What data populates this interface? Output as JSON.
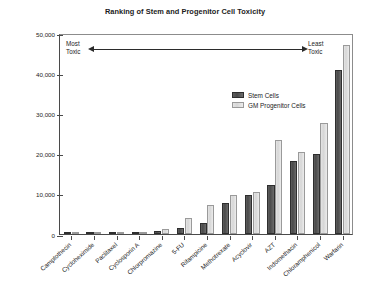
{
  "chart_data": {
    "type": "bar",
    "title": "Ranking of Stem and Progenitor Cell Toxicity",
    "xlabel": "",
    "ylabel": "Area Under the Dose Response Curve",
    "ylim": [
      0,
      50000
    ],
    "yticks": [
      0,
      10000,
      20000,
      30000,
      40000,
      50000
    ],
    "ytick_labels": [
      "0",
      "10,000",
      "20,000",
      "30,000",
      "40,000",
      "50,000"
    ],
    "grid": false,
    "legend_position": "upper center",
    "categories": [
      "Camptothecin",
      "Cycloheximide",
      "Paclitaxel",
      "Cyclosporin A",
      "Chlorpromazine",
      "5-FU",
      "Rifampicine",
      "Methotrexate",
      "Acyclovir",
      "AZT",
      "Indomethacin",
      "Chloramphenicol",
      "Warfarin"
    ],
    "series": [
      {
        "name": "Stem Cells",
        "color": "#4a4a4a",
        "values": [
          60,
          70,
          180,
          500,
          750,
          1600,
          2800,
          7600,
          9800,
          12200,
          18200,
          19800,
          40800
        ]
      },
      {
        "name": "GM Progenitor Cells",
        "color": "#d6d6d6",
        "values": [
          70,
          90,
          200,
          380,
          1150,
          3900,
          7100,
          9750,
          10400,
          23400,
          20300,
          27700,
          47000
        ]
      }
    ],
    "annotations": [
      {
        "id": "most-toxic",
        "text_lines": [
          "Most",
          "Toxic"
        ]
      },
      {
        "id": "least-toxic",
        "text_lines": [
          "Least",
          "Toxic"
        ]
      },
      {
        "id": "direction-arrow",
        "text": "↔"
      }
    ]
  },
  "legend": {
    "items": [
      {
        "label": "Stem Cells",
        "key": "stem"
      },
      {
        "label": "GM Progenitor Cells",
        "key": "prog"
      }
    ]
  },
  "annotation": {
    "most_toxic_line1": "Most",
    "most_toxic_line2": "Toxic",
    "least_toxic_line1": "Least",
    "least_toxic_line2": "Toxic"
  }
}
